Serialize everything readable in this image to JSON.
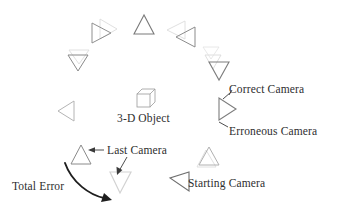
{
  "figure": {
    "background": "#ffffff",
    "width": 338,
    "height": 210
  },
  "labels": {
    "object": "3-D Object",
    "correct_camera": "Correct Camera",
    "erroneous_camera": "Erroneous Camera",
    "last_camera": "Last Camera",
    "starting_camera": "Starting Camera",
    "total_error": "Total Error"
  },
  "colors": {
    "ink_dark": "#2e2e2e",
    "ink_mid": "#6f6f6f",
    "ink_light": "#b9b9b9",
    "ink_faint": "#d8d8d8",
    "arrow": "#1e1e1e",
    "paper": "#ffffff"
  },
  "object": {
    "name": "wireframe-cube",
    "center_x": 145,
    "center_y": 98
  },
  "cameras": [
    {
      "id": "cam-1",
      "role": "correct",
      "cx": 102,
      "cy": 33,
      "size": 20,
      "rotation": 90,
      "tone": "ink_mid"
    },
    {
      "id": "cam-1g",
      "role": "erroneous",
      "cx": 110,
      "cy": 29,
      "size": 20,
      "rotation": 90,
      "tone": "ink_faint"
    },
    {
      "id": "cam-2",
      "role": "correct",
      "cx": 78,
      "cy": 63,
      "size": 18,
      "rotation": 180,
      "tone": "ink_mid"
    },
    {
      "id": "cam-2g",
      "role": "erroneous",
      "cx": 79,
      "cy": 57,
      "size": 18,
      "rotation": 180,
      "tone": "ink_faint"
    },
    {
      "id": "cam-3",
      "role": "correct",
      "cx": 66,
      "cy": 110,
      "size": 18,
      "rotation": 180,
      "tone": "ink_light"
    },
    {
      "id": "cam-4",
      "role": "correct",
      "cx": 81,
      "cy": 155,
      "size": 18,
      "rotation": 0,
      "tone": "ink_mid"
    },
    {
      "id": "cam-5",
      "role": "erroneous",
      "cx": 121,
      "cy": 183,
      "size": 20,
      "rotation": 0,
      "tone": "ink_faint"
    },
    {
      "id": "cam-6",
      "role": "correct",
      "cx": 209,
      "cy": 156,
      "size": 18,
      "rotation": 0,
      "tone": "ink_light"
    },
    {
      "id": "cam-6g",
      "role": "erroneous",
      "cx": 206,
      "cy": 161,
      "size": 18,
      "rotation": 0,
      "tone": "ink_faint"
    },
    {
      "id": "cam-7",
      "role": "starting",
      "cx": 180,
      "cy": 181,
      "size": 19,
      "rotation": 180,
      "tone": "ink_mid"
    },
    {
      "id": "cam-8",
      "role": "correct",
      "cx": 228,
      "cy": 108,
      "size": 20,
      "rotation": 270,
      "tone": "ink_mid"
    },
    {
      "id": "cam-9",
      "role": "correct",
      "cx": 219,
      "cy": 70,
      "size": 19,
      "rotation": 180,
      "tone": "ink_mid"
    },
    {
      "id": "cam-9g",
      "role": "erroneous",
      "cx": 213,
      "cy": 63,
      "size": 16,
      "rotation": 180,
      "tone": "ink_faint"
    },
    {
      "id": "cam-10",
      "role": "correct",
      "cx": 144,
      "cy": 24,
      "size": 19,
      "rotation": 0,
      "tone": "ink_mid"
    },
    {
      "id": "cam-11",
      "role": "correct",
      "cx": 185,
      "cy": 37,
      "size": 20,
      "rotation": 270,
      "tone": "ink_mid"
    },
    {
      "id": "cam-11g",
      "role": "erroneous",
      "cx": 176,
      "cy": 30,
      "size": 18,
      "rotation": 270,
      "tone": "ink_faint"
    }
  ],
  "annotations": {
    "total_error_arc": "curved arrow from last camera down-right to erroneous final pose",
    "leader_lines": [
      "correct-camera leader tick",
      "erroneous-camera leader tick",
      "last-camera horizontal leader with arrowhead",
      "last-camera drop leader with arrowhead"
    ]
  }
}
